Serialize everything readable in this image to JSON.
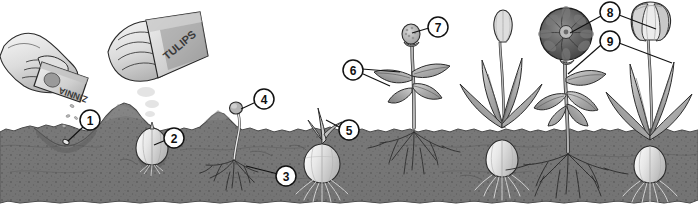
{
  "illustration": {
    "title": "Plant Growth Stages: Zinnia Seeds and Tulip Bulbs",
    "style": "grayscale botanical line illustration",
    "width": 698,
    "height": 208
  },
  "packets": [
    {
      "id": "zinnia-packet",
      "label": "ZINNIA",
      "orientation": "inverted"
    },
    {
      "id": "tulips-packet",
      "label": "TULIPS",
      "orientation": "rotated"
    }
  ],
  "callouts": [
    {
      "number": "1",
      "cx": 90,
      "cy": 120,
      "target_x": 66,
      "target_y": 142,
      "name": "callout-1-seed-in-furrow"
    },
    {
      "number": "2",
      "cx": 174,
      "cy": 138,
      "target_x": 153,
      "target_y": 146,
      "name": "callout-2-bulb-planted"
    },
    {
      "number": "3",
      "cx": 286,
      "cy": 176,
      "target_x": 250,
      "target_y": 166,
      "name": "callout-3-roots"
    },
    {
      "number": "4",
      "cx": 264,
      "cy": 99,
      "target_x": 238,
      "target_y": 112,
      "name": "callout-4-sprouting-seed"
    },
    {
      "number": "5",
      "cx": 349,
      "cy": 130,
      "target_x": 325,
      "target_y": 120,
      "name": "callout-5-bulb-shoot"
    },
    {
      "number": "6",
      "cx": 353,
      "cy": 70,
      "target_x": 398,
      "target_y": 72,
      "name": "callout-6-leaves"
    },
    {
      "number": "7",
      "cx": 438,
      "cy": 27,
      "target_x": 411,
      "target_y": 36,
      "name": "callout-7-flower-bud"
    },
    {
      "number": "8",
      "cx": 610,
      "cy": 12,
      "target_x": 566,
      "target_y": 34,
      "target2_x": 656,
      "target2_y": 28,
      "name": "callout-8-open-flowers"
    },
    {
      "number": "9",
      "cx": 610,
      "cy": 41,
      "target_x": 567,
      "target_y": 74,
      "target2_x": 672,
      "target2_y": 64,
      "name": "callout-9-stems-foliage"
    }
  ],
  "plants": [
    {
      "name": "hand-sowing-zinnia-seeds",
      "stage": "sowing seed"
    },
    {
      "name": "hand-planting-tulip-bulb",
      "stage": "planting bulb"
    },
    {
      "name": "zinnia-seedling",
      "stage": "sprout with roots"
    },
    {
      "name": "tulip-bulb-sprouting",
      "stage": "bulb with shoot and roots"
    },
    {
      "name": "zinnia-young-plant",
      "stage": "leaves and bud"
    },
    {
      "name": "tulip-bud-plant",
      "stage": "closed bud"
    },
    {
      "name": "zinnia-flowering-plant",
      "stage": "open bloom"
    },
    {
      "name": "tulip-flowering-plant",
      "stage": "open tulip"
    }
  ],
  "colors": {
    "soil": "#7b7b7b",
    "soil_dark": "#5f5f5f",
    "soil_shadow": "#4a4a4a",
    "background": "#ffffff",
    "outline": "#1a1a1a",
    "foliage_light": "#cfcfcf",
    "foliage_mid": "#a8a8a8",
    "foliage_dark": "#7d7d7d",
    "bloom_dark": "#5a5a5a",
    "bulb": "#e3e3e3",
    "root": "#f2f2f2",
    "callout_fill": "#ffffff"
  }
}
